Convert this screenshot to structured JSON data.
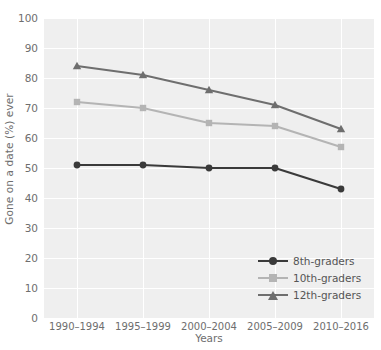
{
  "chart_data": {
    "type": "line",
    "title": "",
    "xlabel": "Years",
    "ylabel": "Gone on a date (%) ever",
    "categories": [
      "1990–1994",
      "1995–1999",
      "2000–2004",
      "2005–2009",
      "2010–2016"
    ],
    "ylim": [
      0,
      100
    ],
    "yticks": [
      0,
      10,
      20,
      30,
      40,
      50,
      60,
      70,
      80,
      90,
      100
    ],
    "grid": true,
    "legend_position": "bottom-right",
    "series": [
      {
        "name": "8th-graders",
        "values": [
          51,
          51,
          50,
          50,
          43
        ],
        "color": "#3a3a3a",
        "marker": "circle"
      },
      {
        "name": "10th-graders",
        "values": [
          72,
          70,
          65,
          64,
          57
        ],
        "color": "#b4b4b4",
        "marker": "square"
      },
      {
        "name": "12th-graders",
        "values": [
          84,
          81,
          76,
          71,
          63
        ],
        "color": "#6e6e6e",
        "marker": "triangle"
      }
    ]
  },
  "legend": {
    "items": [
      {
        "label": "8th-graders"
      },
      {
        "label": "10th-graders"
      },
      {
        "label": "12th-graders"
      }
    ]
  },
  "axes": {
    "y_title": "Gone on a date (%) ever",
    "x_title": "Years",
    "y_tick_labels": [
      "100",
      "90",
      "80",
      "70",
      "60",
      "50",
      "40",
      "30",
      "20",
      "10",
      "0"
    ],
    "x_tick_labels": [
      "1990–1994",
      "1995–1999",
      "2000–2004",
      "2005–2009",
      "2010–2016"
    ]
  },
  "style": {
    "plot_background": "#efefef",
    "grid_color": "#ffffff",
    "text_color": "#6e6e6e",
    "page_background": "#ffffff"
  }
}
